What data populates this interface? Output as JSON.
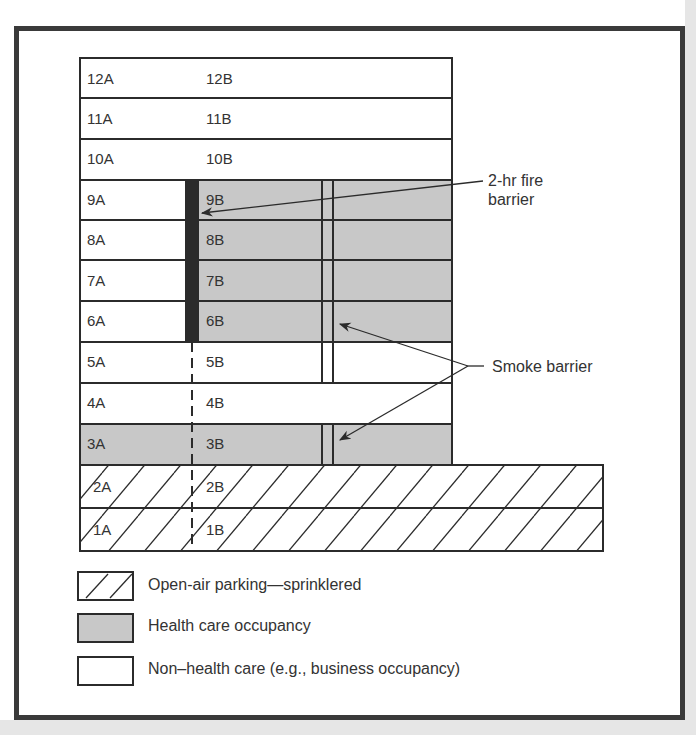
{
  "colors": {
    "health_care_fill": "#c8c8c8",
    "non_health_care_fill": "#ffffff",
    "line": "#2b2b2b",
    "frame": "#3a3a3a",
    "page_gray": "#e6e6e6"
  },
  "floors": [
    {
      "a": "12A",
      "b": "12B",
      "occupancy": "non-health-care"
    },
    {
      "a": "11A",
      "b": "11B",
      "occupancy": "non-health-care"
    },
    {
      "a": "10A",
      "b": "10B",
      "occupancy": "non-health-care"
    },
    {
      "a": "9A",
      "b": "9B",
      "occupancy": "A: non-health-care; B: health-care"
    },
    {
      "a": "8A",
      "b": "8B",
      "occupancy": "A: non-health-care; B: health-care"
    },
    {
      "a": "7A",
      "b": "7B",
      "occupancy": "A: non-health-care; B: health-care"
    },
    {
      "a": "6A",
      "b": "6B",
      "occupancy": "A: non-health-care; B: health-care"
    },
    {
      "a": "5A",
      "b": "5B",
      "occupancy": "non-health-care"
    },
    {
      "a": "4A",
      "b": "4B",
      "occupancy": "non-health-care"
    },
    {
      "a": "3A",
      "b": "3B",
      "occupancy": "health-care"
    },
    {
      "a": "2A",
      "b": "2B",
      "occupancy": "open-air-parking"
    },
    {
      "a": "1A",
      "b": "1B",
      "occupancy": "open-air-parking"
    }
  ],
  "callouts": {
    "fire_barrier": {
      "line1": "2-hr fire",
      "line2": "barrier"
    },
    "smoke_barrier": "Smoke barrier"
  },
  "legend": [
    {
      "swatch": "hatched",
      "label": "Open-air parking—sprinklered"
    },
    {
      "swatch": "gray",
      "label": "Health care occupancy"
    },
    {
      "swatch": "white",
      "label": "Non–health care (e.g., business occupancy)"
    }
  ]
}
